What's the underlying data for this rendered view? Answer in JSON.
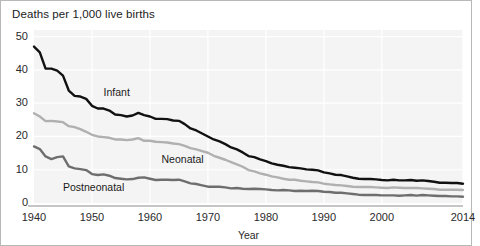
{
  "chart_data": {
    "type": "line",
    "title": "Deaths per 1,000 live births",
    "xlabel": "Year",
    "ylabel": "",
    "xlim": [
      1940,
      2014
    ],
    "ylim": [
      0,
      52
    ],
    "grid": true,
    "legend_position": "inline-annotations",
    "xticks": [
      "1940",
      "1950",
      "1960",
      "1970",
      "1980",
      "1990",
      "2000",
      "2014"
    ],
    "xtick_values": [
      1940,
      1950,
      1960,
      1970,
      1980,
      1990,
      2000,
      2014
    ],
    "yticks": [
      "0",
      "10",
      "20",
      "30",
      "40",
      "50"
    ],
    "ytick_values": [
      0,
      10,
      20,
      30,
      40,
      50
    ],
    "x": [
      1940,
      1941,
      1942,
      1943,
      1944,
      1945,
      1946,
      1947,
      1948,
      1949,
      1950,
      1951,
      1952,
      1953,
      1954,
      1955,
      1956,
      1957,
      1958,
      1959,
      1960,
      1961,
      1962,
      1963,
      1964,
      1965,
      1966,
      1967,
      1968,
      1969,
      1970,
      1971,
      1972,
      1973,
      1974,
      1975,
      1976,
      1977,
      1978,
      1979,
      1980,
      1981,
      1982,
      1983,
      1984,
      1985,
      1986,
      1987,
      1988,
      1989,
      1990,
      1991,
      1992,
      1993,
      1994,
      1995,
      1996,
      1997,
      1998,
      1999,
      2000,
      2001,
      2002,
      2003,
      2004,
      2005,
      2006,
      2007,
      2008,
      2009,
      2010,
      2011,
      2012,
      2013,
      2014
    ],
    "series": [
      {
        "name": "Infant",
        "color": "#111111",
        "label_x": 1952,
        "label_y": 33,
        "values": [
          47.0,
          45.3,
          40.4,
          40.4,
          39.8,
          38.3,
          33.8,
          32.2,
          32.0,
          31.3,
          29.2,
          28.4,
          28.4,
          27.8,
          26.6,
          26.4,
          26.0,
          26.3,
          27.1,
          26.4,
          26.0,
          25.3,
          25.3,
          25.2,
          24.8,
          24.7,
          23.7,
          22.4,
          21.8,
          20.9,
          20.0,
          19.1,
          18.5,
          17.7,
          16.7,
          16.1,
          15.2,
          14.1,
          13.8,
          13.1,
          12.6,
          11.9,
          11.5,
          11.2,
          10.8,
          10.6,
          10.4,
          10.1,
          10.0,
          9.8,
          9.2,
          8.9,
          8.5,
          8.4,
          8.0,
          7.6,
          7.3,
          7.2,
          7.2,
          7.1,
          6.9,
          6.8,
          7.0,
          6.8,
          6.8,
          6.9,
          6.7,
          6.8,
          6.6,
          6.4,
          6.1,
          6.1,
          6.0,
          6.0,
          5.8
        ]
      },
      {
        "name": "Neonatal",
        "color": "#b0b0b0",
        "label_x": 1962,
        "label_y": 13,
        "values": [
          27.0,
          26.0,
          24.6,
          24.7,
          24.5,
          24.3,
          23.1,
          22.8,
          22.2,
          21.4,
          20.5,
          20.0,
          19.8,
          19.6,
          19.1,
          19.1,
          18.9,
          19.1,
          19.5,
          18.7,
          18.7,
          18.4,
          18.3,
          18.2,
          17.9,
          17.7,
          17.2,
          16.5,
          16.1,
          15.6,
          15.1,
          14.2,
          13.6,
          13.0,
          12.3,
          11.6,
          10.9,
          9.9,
          9.5,
          8.9,
          8.5,
          8.0,
          7.7,
          7.3,
          7.0,
          7.0,
          6.7,
          6.5,
          6.3,
          6.2,
          5.8,
          5.6,
          5.4,
          5.3,
          5.1,
          4.9,
          4.8,
          4.8,
          4.8,
          4.7,
          4.6,
          4.5,
          4.7,
          4.6,
          4.5,
          4.5,
          4.5,
          4.4,
          4.3,
          4.2,
          4.0,
          4.0,
          4.0,
          4.0,
          3.9
        ]
      },
      {
        "name": "Postneonatal",
        "color": "#6e6e6e",
        "label_x": 1945,
        "label_y": 4.5,
        "values": [
          17.0,
          16.2,
          14.0,
          13.2,
          13.8,
          14.0,
          11.0,
          10.4,
          10.2,
          9.9,
          8.7,
          8.4,
          8.6,
          8.2,
          7.5,
          7.3,
          7.1,
          7.2,
          7.6,
          7.7,
          7.3,
          6.9,
          7.0,
          7.0,
          6.9,
          7.0,
          6.5,
          5.9,
          5.7,
          5.3,
          4.9,
          4.9,
          4.9,
          4.7,
          4.4,
          4.5,
          4.3,
          4.2,
          4.3,
          4.2,
          4.1,
          3.9,
          3.8,
          3.9,
          3.8,
          3.6,
          3.7,
          3.6,
          3.7,
          3.6,
          3.4,
          3.3,
          3.1,
          3.1,
          2.9,
          2.7,
          2.5,
          2.4,
          2.4,
          2.4,
          2.3,
          2.3,
          2.3,
          2.2,
          2.3,
          2.4,
          2.2,
          2.4,
          2.3,
          2.2,
          2.1,
          2.1,
          2.0,
          2.0,
          1.9
        ]
      }
    ]
  }
}
